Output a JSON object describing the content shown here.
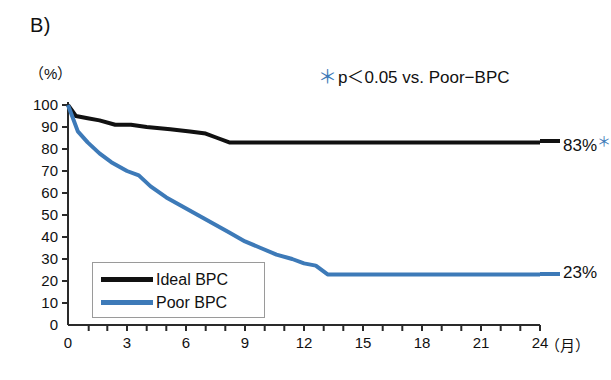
{
  "panel": {
    "label": "B)"
  },
  "annotation": {
    "star": "＊",
    "text": "p＜0.05 vs. Poor−BPC"
  },
  "axes": {
    "y_unit": "（%）",
    "x_unit": "（月）",
    "y_ticks": [
      "100",
      "90",
      "80",
      "70",
      "60",
      "50",
      "40",
      "30",
      "20",
      "10",
      "0"
    ],
    "x_ticks": [
      "0",
      "3",
      "6",
      "9",
      "12",
      "15",
      "18",
      "21",
      "24"
    ]
  },
  "legend": {
    "items": [
      {
        "label": "Ideal BPC",
        "color": "#111111"
      },
      {
        "label": "Poor BPC",
        "color": "#3d7ab8"
      }
    ]
  },
  "endpoints": {
    "ideal": {
      "value": "83%",
      "star": "＊"
    },
    "poor": {
      "value": "23%"
    }
  },
  "chart_data": {
    "type": "line",
    "title": "B)",
    "subtitle": "Kaplan-Meier survival curves by blood pressure control",
    "xlabel": "（月）",
    "ylabel": "（%）",
    "xlim": [
      0,
      24
    ],
    "ylim": [
      0,
      100
    ],
    "xticks": [
      0,
      3,
      6,
      9,
      12,
      15,
      18,
      21,
      24
    ],
    "yticks": [
      0,
      10,
      20,
      30,
      40,
      50,
      60,
      70,
      80,
      90,
      100
    ],
    "grid": false,
    "legend_position": "lower-left-inside",
    "annotations": [
      {
        "text": "＊p＜0.05 vs. Poor−BPC",
        "position": "top-right",
        "color": "#3d7ab8"
      },
      {
        "text": "83%＊",
        "position": "end-of-ideal-series"
      },
      {
        "text": "23%",
        "position": "end-of-poor-series"
      }
    ],
    "series": [
      {
        "name": "Ideal BPC",
        "color": "#111111",
        "final_value": 83,
        "x": [
          0,
          0.4,
          1.0,
          1.6,
          2.4,
          3.2,
          4.0,
          5.2,
          6.2,
          7.0,
          7.6,
          8.2,
          24
        ],
        "values": [
          100,
          95,
          94,
          93,
          91,
          91,
          90,
          89,
          88,
          87,
          85,
          83,
          83
        ]
      },
      {
        "name": "Poor BPC",
        "color": "#3d7ab8",
        "final_value": 23,
        "x": [
          0,
          0.5,
          1.0,
          1.6,
          2.2,
          3.0,
          3.6,
          4.2,
          5.0,
          5.8,
          6.6,
          7.4,
          8.2,
          9.0,
          9.8,
          10.6,
          11.4,
          12.0,
          12.6,
          13.2,
          24
        ],
        "values": [
          100,
          88,
          83,
          78,
          74,
          70,
          68,
          63,
          58,
          54,
          50,
          46,
          42,
          38,
          35,
          32,
          30,
          28,
          27,
          23,
          23
        ]
      }
    ]
  },
  "geometry": {
    "x0": 68,
    "x24": 540,
    "y0": 325,
    "y100": 105
  }
}
